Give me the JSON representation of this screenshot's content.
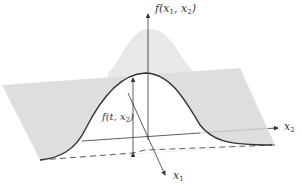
{
  "figure": {
    "type": "3d-surface-slice",
    "colors": {
      "surface": "#e6e6e6",
      "plane": "#dcdcdc",
      "curve": "#333333",
      "axes": "#333333",
      "background": "#ffffff"
    }
  },
  "labels": {
    "z_axis": {
      "base": "f(x",
      "sub1": "1",
      "mid": ", x",
      "sub2": "2",
      "end": ")"
    },
    "x2_axis": {
      "base": "x",
      "sub": "2"
    },
    "x1_axis": {
      "base": "x",
      "sub": "1"
    },
    "slice": {
      "base": "f(t, x",
      "sub": "2",
      "end": ")"
    }
  }
}
